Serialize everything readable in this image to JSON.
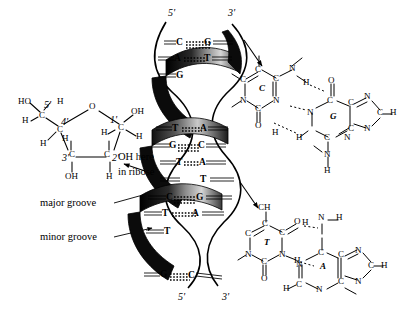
{
  "figure": {
    "colors": {
      "ink": "#000000",
      "background": "#ffffff",
      "ribbon_dark": "#0a0a0a",
      "ribbon_mid": "#6e6e6e",
      "ribbon_light": "#d8d8d8"
    }
  },
  "sugar": {
    "name": "deoxyribose",
    "atoms": {
      "ho": "HO",
      "c5_prime": "5'",
      "h_top": "H",
      "c5": "C",
      "c4_prime": "4'",
      "c4": "C",
      "h_left": "H",
      "h_c4": "H",
      "o_ring": "O",
      "c1_prime": "1'",
      "c1": "C",
      "oh_right": "OH",
      "h_right": "H",
      "h_c1_left": "H",
      "c3_prime_num": "3'",
      "c3": "C",
      "c2": "C",
      "c2_prime_num": "2'",
      "oh_bottom": "OH",
      "h_bottom": "H",
      "h_c3": "H"
    },
    "annotation_line1": "OH here",
    "annotation_line2": "in ribose"
  },
  "helix": {
    "top_left_label": "5'",
    "top_right_label": "3'",
    "bottom_left_label": "5'",
    "bottom_right_label": "3'",
    "grooves": {
      "major": "major groove",
      "minor": "minor groove"
    },
    "base_pairs": [
      {
        "left": "C",
        "bond": "≡",
        "right": "G",
        "bonds": 3
      },
      {
        "left": "A",
        "bond": "=",
        "right": "T",
        "bonds": 2
      },
      {
        "left": "G",
        "bond": "",
        "right": "",
        "bonds": 0
      },
      {
        "left": "T",
        "bond": "=",
        "right": "A",
        "bonds": 2
      },
      {
        "left": "G",
        "bond": "≡",
        "right": "C",
        "bonds": 3
      },
      {
        "left": "T",
        "bond": "=",
        "right": "A",
        "bonds": 2
      },
      {
        "left": "T",
        "bond": "",
        "right": "",
        "bonds": 0
      },
      {
        "left": "C",
        "bond": "≡",
        "right": "G",
        "bonds": 3
      },
      {
        "left": "T",
        "bond": "=",
        "right": "A",
        "bonds": 2
      },
      {
        "left": "T",
        "bond": "",
        "right": "",
        "bonds": 0
      },
      {
        "left": "G",
        "bond": "≡",
        "right": "C",
        "bonds": 3
      }
    ]
  },
  "gc_pair": {
    "name": "guanine-cytosine base pair",
    "hydrogen_bonds": 3,
    "cytosine": {
      "ring_label": "C",
      "n1": "N",
      "n3": "N",
      "c2": "C",
      "c4": "C",
      "c5": "C",
      "c6": "C",
      "o2": "O",
      "n4": "N",
      "h_n4": "H",
      "h_o": "H"
    },
    "guanine": {
      "ring_label": "G",
      "o6": "O",
      "c6": "C",
      "c5": "C",
      "c4": "C",
      "n1": "N",
      "n3": "N",
      "n7": "N",
      "n9": "N",
      "c2": "C",
      "c8": "C",
      "h_c8": "H",
      "h_n1": "H",
      "h_n2": "H",
      "n2": "N"
    }
  },
  "ta_pair": {
    "name": "thymine-adenine base pair",
    "hydrogen_bonds": 2,
    "methyl_label": "CH",
    "thymine": {
      "ring_label": "T",
      "n1": "N",
      "n3": "N",
      "c2": "C",
      "c4": "C",
      "c5": "C",
      "c6": "C",
      "o2": "O",
      "o4": "O",
      "h_n3": "H"
    },
    "adenine": {
      "ring_label": "A",
      "n1": "N",
      "n3": "N",
      "n6": "N",
      "n7": "N",
      "n9": "N",
      "c2": "C",
      "c4": "C",
      "c5": "C",
      "c6": "C",
      "c8": "C",
      "h_n6a": "H",
      "h_n6b": "H",
      "h_c8": "H",
      "h_c2": "H"
    }
  }
}
